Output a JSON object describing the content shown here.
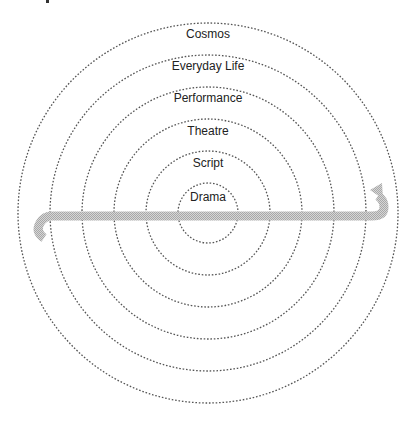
{
  "diagram": {
    "type": "concentric-circles",
    "center": [
      208,
      213
    ],
    "rings": [
      {
        "label": "Drama",
        "radius": 30
      },
      {
        "label": "Script",
        "radius": 62
      },
      {
        "label": "Theatre",
        "radius": 94
      },
      {
        "label": "Performance",
        "radius": 126
      },
      {
        "label": "Everyday Life",
        "radius": 158
      },
      {
        "label": "Cosmos",
        "radius": 190
      }
    ],
    "arrow": {
      "description": "Horizontal bidirectional hooked arrow crossing all rings",
      "color": "#bdbdbd"
    },
    "colors": {
      "ring_stroke": "#555555",
      "text": "#222222",
      "arrow_fill": "#bdbdbd"
    }
  }
}
